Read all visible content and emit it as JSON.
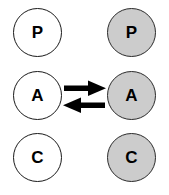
{
  "diagram": {
    "colors": {
      "white_fill": "#ffffff",
      "gray_fill": "#cccccc",
      "stroke": "#1a1a1a",
      "arrow": "#000000",
      "background": "#ffffff"
    },
    "columns": [
      {
        "name": "left-column",
        "fill": "white"
      },
      {
        "name": "right-column",
        "fill": "gray"
      }
    ],
    "rows": [
      {
        "name": "row-p",
        "left": {
          "label": "P",
          "fill": "white"
        },
        "right": {
          "label": "P",
          "fill": "gray"
        }
      },
      {
        "name": "row-a",
        "left": {
          "label": "A",
          "fill": "white"
        },
        "right": {
          "label": "A",
          "fill": "gray"
        }
      },
      {
        "name": "row-c",
        "left": {
          "label": "C",
          "fill": "white"
        },
        "right": {
          "label": "C",
          "fill": "gray"
        }
      }
    ],
    "arrows": [
      {
        "name": "arrow-left-to-right",
        "direction": "right",
        "label": ""
      },
      {
        "name": "arrow-right-to-left",
        "direction": "left",
        "label": ""
      }
    ]
  }
}
